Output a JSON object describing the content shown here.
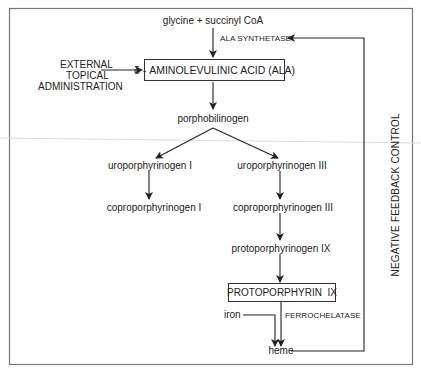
{
  "diagram": {
    "nodes": {
      "substrate": "glycine + succinyl CoA",
      "ala": "δ - AMINOLEVULINIC ACID (ALA)",
      "porphobilinogen": "porphobilinogen",
      "uro_i": "uroporphyrinogen I",
      "uro_iii": "uroporphyrinogen III",
      "copro_i": "coproporphyrinogen I",
      "copro_iii": "coproporphyrinogen III",
      "protoporphyrinogen": "protoporphyrinogen IX",
      "protoporphyrin": "PROTOPORPHYRIN  IX",
      "iron": "iron",
      "heme": "heme"
    },
    "enzymes": {
      "ala_synthetase": "ALA SYNTHETASE",
      "ferrochelatase": "FERROCHELATASE"
    },
    "external": {
      "line1": "EXTERNAL",
      "line2": "TOPICAL",
      "line3": "ADMINISTRATION"
    },
    "feedback_label": "NEGATIVE FEEDBACK CONTROL",
    "edges": [
      {
        "from": "substrate",
        "to": "ala",
        "label": "ALA SYNTHETASE"
      },
      {
        "from": "external",
        "to": "ala"
      },
      {
        "from": "ala",
        "to": "porphobilinogen"
      },
      {
        "from": "porphobilinogen",
        "to": "uro_i"
      },
      {
        "from": "porphobilinogen",
        "to": "uro_iii"
      },
      {
        "from": "uro_i",
        "to": "copro_i"
      },
      {
        "from": "uro_iii",
        "to": "copro_iii"
      },
      {
        "from": "copro_iii",
        "to": "protoporphyrinogen"
      },
      {
        "from": "protoporphyrinogen",
        "to": "protoporphyrin"
      },
      {
        "from": "protoporphyrin",
        "to": "heme",
        "label": "FERROCHELATASE"
      },
      {
        "from": "iron",
        "to": "heme"
      },
      {
        "from": "heme",
        "to": "ala_synthetase",
        "label": "NEGATIVE FEEDBACK CONTROL"
      }
    ],
    "colors": {
      "line": "#333333",
      "border": "#666666",
      "artifact": "#d8d8d8"
    }
  }
}
